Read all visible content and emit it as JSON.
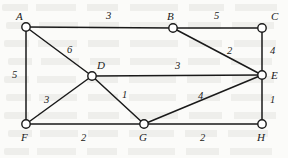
{
  "figure": {
    "type": "weighted-undirected-graph",
    "width": 288,
    "height": 158,
    "background_color": "#fbfbf9",
    "stroke_color": "#1a1a1a",
    "node_fill": "#ffffff",
    "node_radius": 4.2,
    "edge_width": 1.5
  },
  "nodes": [
    {
      "id": "A",
      "label": "A",
      "x": 26,
      "y": 27,
      "label_x": 16,
      "label_y": 11
    },
    {
      "id": "B",
      "label": "B",
      "x": 173,
      "y": 28,
      "label_x": 167,
      "label_y": 11
    },
    {
      "id": "C",
      "label": "C",
      "x": 262,
      "y": 28,
      "label_x": 271,
      "label_y": 11
    },
    {
      "id": "D",
      "label": "D",
      "x": 92,
      "y": 76,
      "label_x": 97,
      "label_y": 60
    },
    {
      "id": "E",
      "label": "E",
      "x": 262,
      "y": 75,
      "label_x": 271,
      "label_y": 70
    },
    {
      "id": "F",
      "label": "F",
      "x": 26,
      "y": 124,
      "label_x": 21,
      "label_y": 132
    },
    {
      "id": "G",
      "label": "G",
      "x": 144,
      "y": 124,
      "label_x": 139,
      "label_y": 132
    },
    {
      "id": "H",
      "label": "H",
      "x": 262,
      "y": 124,
      "label_x": 257,
      "label_y": 132
    }
  ],
  "edges": [
    {
      "id": "AB",
      "from": "A",
      "to": "B",
      "weight": "3",
      "label_x": 106,
      "label_y": 11
    },
    {
      "id": "BC",
      "from": "B",
      "to": "C",
      "weight": "5",
      "label_x": 214,
      "label_y": 11
    },
    {
      "id": "AD",
      "from": "A",
      "to": "D",
      "weight": "6",
      "label_x": 67,
      "label_y": 45
    },
    {
      "id": "AF",
      "from": "A",
      "to": "F",
      "weight": "5",
      "label_x": 12,
      "label_y": 70
    },
    {
      "id": "BE",
      "from": "B",
      "to": "E",
      "weight": "2",
      "label_x": 227,
      "label_y": 46
    },
    {
      "id": "CE",
      "from": "C",
      "to": "E",
      "weight": "4",
      "label_x": 270,
      "label_y": 46
    },
    {
      "id": "DE",
      "from": "D",
      "to": "E",
      "weight": "3",
      "label_x": 175,
      "label_y": 61
    },
    {
      "id": "DF",
      "from": "D",
      "to": "F",
      "weight": "3",
      "label_x": 44,
      "label_y": 95
    },
    {
      "id": "DG",
      "from": "D",
      "to": "G",
      "weight": "1",
      "label_x": 122,
      "label_y": 90
    },
    {
      "id": "FG",
      "from": "F",
      "to": "G",
      "weight": "2",
      "label_x": 81,
      "label_y": 133
    },
    {
      "id": "GE",
      "from": "G",
      "to": "E",
      "weight": "4",
      "label_x": 198,
      "label_y": 91
    },
    {
      "id": "GH",
      "from": "G",
      "to": "H",
      "weight": "2",
      "label_x": 200,
      "label_y": 133
    },
    {
      "id": "EH",
      "from": "E",
      "to": "H",
      "weight": "1",
      "label_x": 270,
      "label_y": 95
    }
  ],
  "background_text_lines": [
    {
      "x": 2,
      "y": 4,
      "width": 284
    },
    {
      "x": 6,
      "y": 22,
      "width": 276
    },
    {
      "x": 4,
      "y": 40,
      "width": 280
    },
    {
      "x": 8,
      "y": 58,
      "width": 272
    },
    {
      "x": 4,
      "y": 76,
      "width": 278
    },
    {
      "x": 6,
      "y": 94,
      "width": 274
    },
    {
      "x": 4,
      "y": 112,
      "width": 280
    },
    {
      "x": 8,
      "y": 130,
      "width": 268
    },
    {
      "x": 4,
      "y": 148,
      "width": 276
    }
  ]
}
